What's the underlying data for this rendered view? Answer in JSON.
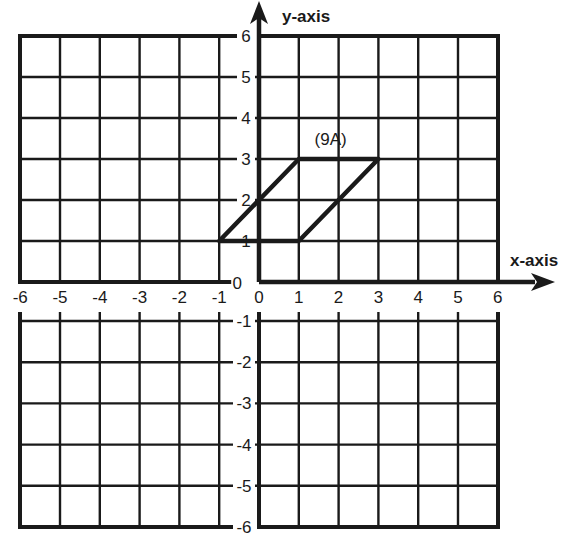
{
  "chart_data": {
    "type": "coordinate-grid",
    "title": "",
    "xlabel": "x-axis",
    "ylabel": "y-axis",
    "xlim": [
      -6,
      6
    ],
    "ylim": [
      -6,
      6
    ],
    "grid": true,
    "x_ticks": [
      "-6",
      "-5",
      "-4",
      "-3",
      "-2",
      "-1",
      "0",
      "1",
      "2",
      "3",
      "4",
      "5",
      "6"
    ],
    "y_ticks": [
      "6",
      "5",
      "4",
      "3",
      "2",
      "1",
      "0",
      "-1",
      "-2",
      "-3",
      "-4",
      "-5",
      "-6"
    ],
    "shapes": [
      {
        "name": "parallelogram",
        "label": "(9A)",
        "vertices": [
          [
            -1,
            1
          ],
          [
            1,
            1
          ],
          [
            3,
            3
          ],
          [
            1,
            3
          ]
        ]
      }
    ]
  },
  "labels": {
    "x_axis": "x-axis",
    "y_axis": "y-axis",
    "shape_label": "(9A)"
  },
  "colors": {
    "line": "#1a1a1a",
    "background": "#ffffff"
  }
}
